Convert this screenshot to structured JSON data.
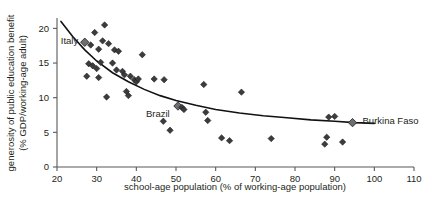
{
  "chart_data": {
    "type": "scatter",
    "title": "",
    "xlabel": "school-age population (% of working-age population)",
    "ylabel": "generosity of public education benefit (% GDP/working-age adult)",
    "xlim": [
      20,
      110
    ],
    "ylim": [
      0,
      21.5
    ],
    "xticks": [
      20,
      30,
      40,
      50,
      60,
      70,
      80,
      90,
      100,
      110
    ],
    "yticks": [
      0,
      5,
      10,
      15,
      20
    ],
    "xtick_labels": [
      "20",
      "30",
      "40",
      "50",
      "60",
      "70",
      "80",
      "90",
      "100",
      "110"
    ],
    "ytick_labels": [
      "0",
      "5",
      "10",
      "15",
      "20"
    ],
    "grid": false,
    "legend": "none",
    "marker": "diamond",
    "point_color": "#3c3c3f",
    "highlight_color": "#6e6e70",
    "fit_color": "#111113",
    "fit_curve": {
      "name": "fitted trend",
      "type": "power",
      "x": [
        21,
        24,
        27,
        30,
        34,
        38,
        42,
        46,
        50,
        55,
        60,
        66,
        72,
        78,
        84,
        90,
        95,
        100
      ],
      "y": [
        21.0,
        18.8,
        16.9,
        15.3,
        13.6,
        12.3,
        11.2,
        10.3,
        9.6,
        8.9,
        8.3,
        7.8,
        7.4,
        7.1,
        6.8,
        6.6,
        6.4,
        6.3
      ]
    },
    "points": [
      {
        "x": 27.0,
        "y": 18.0,
        "label": "Italy",
        "highlight": true
      },
      {
        "x": 28.5,
        "y": 17.6
      },
      {
        "x": 29.5,
        "y": 19.4
      },
      {
        "x": 30.5,
        "y": 17.0
      },
      {
        "x": 31.5,
        "y": 18.2
      },
      {
        "x": 32.0,
        "y": 20.5
      },
      {
        "x": 33.0,
        "y": 17.8
      },
      {
        "x": 34.5,
        "y": 16.9
      },
      {
        "x": 35.5,
        "y": 16.7
      },
      {
        "x": 41.5,
        "y": 16.2
      },
      {
        "x": 28.0,
        "y": 14.9
      },
      {
        "x": 29.0,
        "y": 14.6
      },
      {
        "x": 30.0,
        "y": 14.2
      },
      {
        "x": 31.0,
        "y": 15.1
      },
      {
        "x": 34.0,
        "y": 15.0
      },
      {
        "x": 35.0,
        "y": 14.0
      },
      {
        "x": 36.5,
        "y": 13.8
      },
      {
        "x": 37.0,
        "y": 13.3
      },
      {
        "x": 27.5,
        "y": 13.1
      },
      {
        "x": 30.5,
        "y": 12.9
      },
      {
        "x": 38.5,
        "y": 13.1
      },
      {
        "x": 39.5,
        "y": 12.6
      },
      {
        "x": 40.0,
        "y": 12.3
      },
      {
        "x": 40.5,
        "y": 12.7
      },
      {
        "x": 44.5,
        "y": 12.7
      },
      {
        "x": 47.0,
        "y": 12.6
      },
      {
        "x": 57.0,
        "y": 11.9
      },
      {
        "x": 66.5,
        "y": 10.8
      },
      {
        "x": 37.5,
        "y": 10.9
      },
      {
        "x": 38.0,
        "y": 10.3
      },
      {
        "x": 32.5,
        "y": 10.1
      },
      {
        "x": 50.5,
        "y": 8.8,
        "label": "Brazil",
        "highlight": true
      },
      {
        "x": 51.5,
        "y": 8.6
      },
      {
        "x": 52.0,
        "y": 8.3
      },
      {
        "x": 57.5,
        "y": 7.9
      },
      {
        "x": 58.0,
        "y": 6.7
      },
      {
        "x": 46.8,
        "y": 6.6
      },
      {
        "x": 48.5,
        "y": 5.3
      },
      {
        "x": 61.5,
        "y": 4.2
      },
      {
        "x": 63.5,
        "y": 3.8
      },
      {
        "x": 74.0,
        "y": 4.1
      },
      {
        "x": 88.5,
        "y": 7.2
      },
      {
        "x": 90.0,
        "y": 7.3
      },
      {
        "x": 94.5,
        "y": 6.4,
        "label": "Burkina Faso",
        "highlight": true
      },
      {
        "x": 88.0,
        "y": 4.3
      },
      {
        "x": 87.5,
        "y": 3.3
      },
      {
        "x": 92.0,
        "y": 3.6
      }
    ],
    "annotations": [
      {
        "text": "Italy",
        "x": 27.0,
        "y": 18.0
      },
      {
        "text": "Brazil",
        "x": 50.5,
        "y": 8.8
      },
      {
        "text": "Burkina Faso",
        "x": 94.5,
        "y": 6.4
      }
    ]
  }
}
